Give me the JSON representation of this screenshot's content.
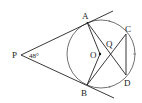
{
  "diagram": {
    "type": "geometry",
    "labels": {
      "P": "P",
      "A": "A",
      "B": "B",
      "C": "C",
      "D": "D",
      "O": "O",
      "Q": "Q"
    },
    "angle_P": "48°",
    "colors": {
      "stroke": "#222222",
      "background": "#ffffff"
    }
  }
}
